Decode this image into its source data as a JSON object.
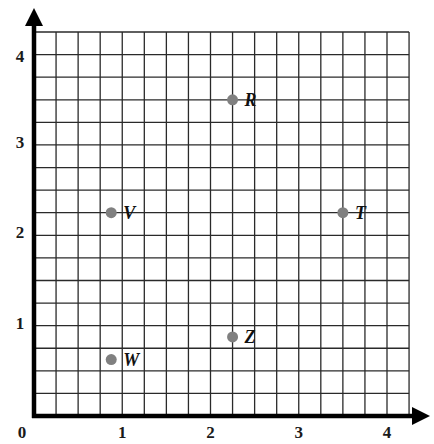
{
  "chart_data": {
    "type": "scatter",
    "title": "",
    "xlabel": "",
    "ylabel": "",
    "xlim": [
      0,
      4.25
    ],
    "ylim": [
      0,
      4.25
    ],
    "grid": true,
    "grid_step": 0.25,
    "x_ticks": [
      0,
      1,
      2,
      3,
      4
    ],
    "y_ticks": [
      1,
      2,
      3,
      4
    ],
    "x_tick_labels": [
      "0",
      "1",
      "2",
      "3",
      "4"
    ],
    "y_tick_labels": [
      "1",
      "2",
      "3",
      "4"
    ],
    "legend": null,
    "points": [
      {
        "label": "R",
        "x": 2.25,
        "y": 3.5
      },
      {
        "label": "V",
        "x": 0.875,
        "y": 2.25
      },
      {
        "label": "T",
        "x": 3.5,
        "y": 2.25
      },
      {
        "label": "Z",
        "x": 2.25,
        "y": 0.875
      },
      {
        "label": "W",
        "x": 0.875,
        "y": 0.625
      }
    ],
    "colors": {
      "point": "#808080",
      "grid": "#2a2a2a",
      "axis": "#000000"
    }
  }
}
